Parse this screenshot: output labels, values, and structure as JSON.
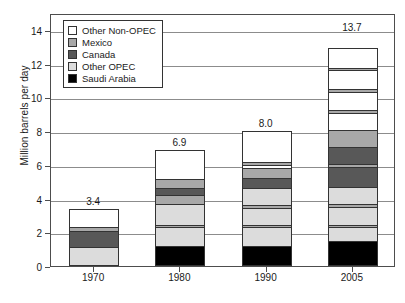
{
  "chart_data": {
    "type": "bar",
    "stacked": true,
    "title": "",
    "xlabel": "",
    "ylabel": "Million barrels per day",
    "categories": [
      "1970",
      "1980",
      "1990",
      "2005"
    ],
    "ylim": [
      0,
      15
    ],
    "yticks": [
      0,
      2,
      4,
      6,
      8,
      10,
      12,
      14
    ],
    "ytick_labels": [
      "0",
      "2",
      "4",
      "6",
      "8",
      "10",
      "12",
      "14"
    ],
    "grid": true,
    "legend_position": "upper left",
    "bar_totals": [
      "3.4",
      "6.9",
      "8.0",
      "13.7"
    ],
    "bar_total_values": [
      3.4,
      6.9,
      8.0,
      13.7
    ],
    "series": [
      {
        "name": "Saudi Arabia",
        "color": "#000000",
        "values": [
          0.0,
          1.2,
          1.2,
          1.5
        ]
      },
      {
        "name": "Other OPEC",
        "color": "#dcdcdc",
        "values": [
          1.15,
          2.3,
          2.25,
          3.15
        ]
      },
      {
        "name": "Canada",
        "color": "#585858",
        "values": [
          0.9,
          0.4,
          0.6,
          1.2
        ]
      },
      {
        "name": "Mexico",
        "color": "#a8a8a8",
        "values": [
          0.25,
          0.7,
          0.85,
          1.65
        ]
      },
      {
        "name": "Other Non-OPEC",
        "color": "#ffffff",
        "values": [
          1.1,
          2.3,
          3.1,
          6.2
        ]
      }
    ],
    "legend_order": [
      "Other Non-OPEC",
      "Mexico",
      "Canada",
      "Other OPEC",
      "Saudi Arabia"
    ],
    "legend": [
      {
        "label": "Other Non-OPEC",
        "color": "#ffffff"
      },
      {
        "label": "Mexico",
        "color": "#a8a8a8"
      },
      {
        "label": "Canada",
        "color": "#585858"
      },
      {
        "label": "Other OPEC",
        "color": "#dcdcdc"
      },
      {
        "label": "Saudi Arabia",
        "color": "#000000"
      }
    ],
    "bars": [
      {
        "category": "1970",
        "total": "3.4",
        "segments": [
          {
            "series": "Other OPEC",
            "value": 1.15,
            "color": "#dcdcdc"
          },
          {
            "series": "Canada",
            "value": 0.9,
            "color": "#585858"
          },
          {
            "series": "Mexico",
            "value": 0.25,
            "color": "#a8a8a8"
          },
          {
            "series": "Other Non-OPEC",
            "value": 1.1,
            "color": "#ffffff"
          }
        ]
      },
      {
        "category": "1980",
        "total": "6.9",
        "segments": [
          {
            "series": "Saudi Arabia",
            "value": 1.2,
            "color": "#000000"
          },
          {
            "series": "Other OPEC",
            "value": 1.1,
            "color": "#dcdcdc"
          },
          {
            "series": "Mexico",
            "value": 0.15,
            "color": "#a8a8a8"
          },
          {
            "series": "Other OPEC",
            "value": 1.2,
            "color": "#dcdcdc"
          },
          {
            "series": "Mexico",
            "value": 0.55,
            "color": "#a8a8a8"
          },
          {
            "series": "Canada",
            "value": 0.4,
            "color": "#585858"
          },
          {
            "series": "Mexico",
            "value": 0.55,
            "color": "#a8a8a8"
          },
          {
            "series": "Other Non-OPEC",
            "value": 1.75,
            "color": "#ffffff"
          }
        ]
      },
      {
        "category": "1990",
        "total": "8.0",
        "segments": [
          {
            "series": "Saudi Arabia",
            "value": 1.2,
            "color": "#000000"
          },
          {
            "series": "Other OPEC",
            "value": 1.1,
            "color": "#dcdcdc"
          },
          {
            "series": "Mexico",
            "value": 0.15,
            "color": "#a8a8a8"
          },
          {
            "series": "Other OPEC",
            "value": 1.0,
            "color": "#dcdcdc"
          },
          {
            "series": "Mexico",
            "value": 0.15,
            "color": "#a8a8a8"
          },
          {
            "series": "Other OPEC",
            "value": 1.05,
            "color": "#dcdcdc"
          },
          {
            "series": "Canada",
            "value": 0.6,
            "color": "#585858"
          },
          {
            "series": "Mexico",
            "value": 0.55,
            "color": "#a8a8a8"
          },
          {
            "series": "Other Non-OPEC",
            "value": 0.2,
            "color": "#ffffff"
          },
          {
            "series": "Mexico",
            "value": 0.15,
            "color": "#a8a8a8"
          },
          {
            "series": "Other Non-OPEC",
            "value": 1.85,
            "color": "#ffffff"
          }
        ]
      },
      {
        "category": "2005",
        "total": "13.7",
        "segments": [
          {
            "series": "Saudi Arabia",
            "value": 1.5,
            "color": "#000000"
          },
          {
            "series": "Other OPEC",
            "value": 0.8,
            "color": "#dcdcdc"
          },
          {
            "series": "Mexico",
            "value": 0.15,
            "color": "#a8a8a8"
          },
          {
            "series": "Other OPEC",
            "value": 1.05,
            "color": "#dcdcdc"
          },
          {
            "series": "Mexico",
            "value": 0.15,
            "color": "#a8a8a8"
          },
          {
            "series": "Other OPEC",
            "value": 1.05,
            "color": "#dcdcdc"
          },
          {
            "series": "Canada",
            "value": 1.2,
            "color": "#585858"
          },
          {
            "series": "Mexico",
            "value": 0.15,
            "color": "#a8a8a8"
          },
          {
            "series": "Canada",
            "value": 1.0,
            "color": "#585858"
          },
          {
            "series": "Mexico",
            "value": 1.0,
            "color": "#a8a8a8"
          },
          {
            "series": "Other Non-OPEC",
            "value": 1.05,
            "color": "#ffffff"
          },
          {
            "series": "Mexico",
            "value": 0.15,
            "color": "#a8a8a8"
          },
          {
            "series": "Other Non-OPEC",
            "value": 1.1,
            "color": "#ffffff"
          },
          {
            "series": "Mexico",
            "value": 0.15,
            "color": "#a8a8a8"
          },
          {
            "series": "Other Non-OPEC",
            "value": 1.1,
            "color": "#ffffff"
          },
          {
            "series": "Mexico",
            "value": 0.15,
            "color": "#a8a8a8"
          },
          {
            "series": "Other Non-OPEC",
            "value": 1.2,
            "color": "#ffffff"
          }
        ]
      }
    ]
  }
}
